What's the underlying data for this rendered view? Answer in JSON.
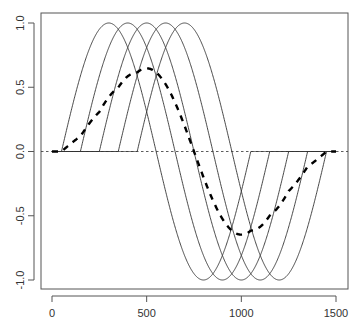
{
  "chart_data": {
    "type": "line",
    "title": "",
    "xlabel": "",
    "ylabel": "",
    "xlim": [
      -80,
      1530
    ],
    "ylim": [
      -1.08,
      1.08
    ],
    "grid": false,
    "legend": null,
    "x_ticks": [
      0,
      500,
      1000,
      1500
    ],
    "x_tick_labels": [
      "0",
      "500",
      "1000",
      "1500"
    ],
    "y_ticks": [
      -1.0,
      -0.5,
      0.0,
      0.5,
      1.0
    ],
    "y_tick_labels": [
      "-1.0",
      "-0.5",
      "0.0",
      "0.5",
      "1.0"
    ],
    "x_range": [
      0,
      1500
    ],
    "series": [
      {
        "name": "shifted sine 1",
        "style": "solid",
        "onset": 50,
        "period": 1000,
        "amplitude": 1.0,
        "peak_x": 300,
        "trough_x": 800
      },
      {
        "name": "shifted sine 2",
        "style": "solid",
        "onset": 150,
        "period": 1000,
        "amplitude": 1.0,
        "peak_x": 400,
        "trough_x": 900
      },
      {
        "name": "shifted sine 3",
        "style": "solid",
        "onset": 250,
        "period": 1000,
        "amplitude": 1.0,
        "peak_x": 500,
        "trough_x": 1000
      },
      {
        "name": "shifted sine 4",
        "style": "solid",
        "onset": 350,
        "period": 1000,
        "amplitude": 1.0,
        "peak_x": 600,
        "trough_x": 1100
      },
      {
        "name": "shifted sine 5",
        "style": "solid",
        "onset": 450,
        "period": 1000,
        "amplitude": 1.0,
        "peak_x": 700,
        "trough_x": 1200
      },
      {
        "name": "mean of shifted sines",
        "style": "dashed-thick",
        "peak_value": 0.647,
        "peak_x": 500,
        "trough_value": -0.647,
        "trough_x": 1000
      }
    ],
    "reference_lines": [
      {
        "orientation": "horizontal",
        "y": 0.0,
        "style": "dotted"
      }
    ]
  },
  "plot_area": {
    "frame": {
      "left": 41,
      "top": 13,
      "right": 348,
      "bottom": 289
    },
    "x_map": {
      "v0": 0,
      "px0": 52,
      "v1": 1500,
      "px1": 336
    },
    "y_map": {
      "v0": 1.0,
      "px0": 23,
      "v1": -1.0,
      "px1": 280
    }
  },
  "colors": {
    "curve": "#333333",
    "mean_curve": "#000000",
    "frame": "#555555",
    "text": "#333333"
  }
}
